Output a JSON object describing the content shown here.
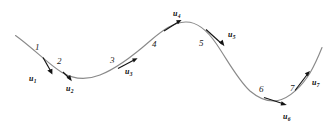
{
  "figure": {
    "background_color": "#ffffff",
    "curve_color": "#8a8a8a",
    "arrow_color": "#131313",
    "text_color": "#1a1a1a",
    "width": 333,
    "height": 132
  },
  "curve": {
    "name": "smooth-s-curve",
    "path": "M 15.5 35.5 C 33 48 48 64 62 72.5 C 74 79.5 86 80.5 100 75 C 118 68 134 55 150 41 C 163 30 173 22.5 185.5 22 C 197 21.6 207 30 216.5 44 C 228 61 238 80 250 91 C 259.5 99 268 102.5 278 100.5 C 290 98 302 86 310 73 C 315.5 63.5 319 55 322 47.5",
    "endpoints": {
      "start": [
        15.5,
        35.5
      ],
      "end": [
        322,
        47.5
      ]
    },
    "extrema": {
      "trough_1": [
        85,
        79
      ],
      "peak": [
        185,
        22
      ],
      "trough_2": [
        278,
        101
      ]
    }
  },
  "points": [
    {
      "id": 1,
      "label": "1",
      "label_x": 35,
      "label_y": 43,
      "curve_x": 43,
      "curve_y": 58
    },
    {
      "id": 2,
      "label": "2",
      "label_x": 57,
      "label_y": 57,
      "curve_x": 62,
      "curve_y": 72
    },
    {
      "id": 3,
      "label": "3",
      "label_x": 110,
      "label_y": 56,
      "curve_x": 117,
      "curve_y": 68
    },
    {
      "id": 4,
      "label": "4",
      "label_x": 152,
      "label_y": 40,
      "curve_x": 150,
      "curve_y": 41
    },
    {
      "id": 5,
      "label": "5",
      "label_x": 199,
      "label_y": 39,
      "curve_x": 203,
      "curve_y": 27
    },
    {
      "id": 6,
      "label": "6",
      "label_x": 259,
      "label_y": 85,
      "curve_x": 262,
      "curve_y": 96
    },
    {
      "id": 7,
      "label": "7",
      "label_x": 290,
      "label_y": 84,
      "curve_x": 296,
      "curve_y": 88
    }
  ],
  "vectors": [
    {
      "id": 1,
      "name": "u",
      "subscript": "1",
      "label_x": 29,
      "label_y": 75,
      "tail": [
        43,
        57
      ],
      "tip": [
        52,
        73
      ],
      "direction": "down-right"
    },
    {
      "id": 2,
      "name": "u",
      "subscript": "2",
      "label_x": 66,
      "label_y": 85,
      "tail": [
        63,
        72
      ],
      "tip": [
        71,
        80
      ],
      "direction": "down-right"
    },
    {
      "id": 3,
      "name": "u",
      "subscript": "3",
      "label_x": 125,
      "label_y": 68,
      "tail": [
        118,
        68
      ],
      "tip": [
        137,
        59
      ],
      "direction": "up-right"
    },
    {
      "id": 4,
      "name": "u",
      "subscript": "4",
      "label_x": 173,
      "label_y": 10,
      "tail": [
        164,
        30
      ],
      "tip": [
        180,
        20
      ],
      "direction": "up-right"
    },
    {
      "id": 5,
      "name": "u",
      "subscript": "5",
      "label_x": 228,
      "label_y": 31,
      "tail": [
        206,
        30
      ],
      "tip": [
        224,
        46
      ],
      "direction": "down-right"
    },
    {
      "id": 6,
      "name": "u",
      "subscript": "6",
      "label_x": 283,
      "label_y": 113,
      "tail": [
        264,
        97
      ],
      "tip": [
        286,
        105
      ],
      "direction": "down-right"
    },
    {
      "id": 7,
      "name": "u",
      "subscript": "7",
      "label_x": 312,
      "label_y": 79,
      "tail": [
        295,
        90
      ],
      "tip": [
        310,
        72
      ],
      "direction": "up-right"
    }
  ]
}
